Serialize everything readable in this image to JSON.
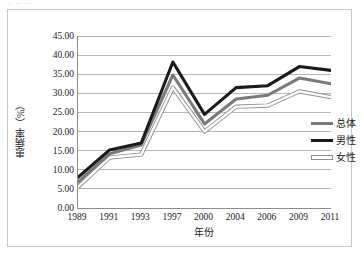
{
  "figure": {
    "top_caption_fragment": "— — —"
  },
  "chart_data": {
    "type": "line",
    "title": "",
    "xlabel": "年份",
    "ylabel": "患病率（%）",
    "categories": [
      "1989",
      "1991",
      "1993",
      "1997",
      "2000",
      "2004",
      "2006",
      "2009",
      "2011"
    ],
    "ylim": [
      0,
      45
    ],
    "ytick_interval": 5,
    "ytick_labels": [
      "45.00",
      "40.00",
      "35.00",
      "30.00",
      "25.00",
      "20.00",
      "15.00",
      "10.00",
      "5.00",
      "0.00"
    ],
    "ytick_values": [
      45,
      40,
      35,
      30,
      25,
      20,
      15,
      10,
      5,
      0
    ],
    "grid": "horizontal",
    "legend_position": "right",
    "series": [
      {
        "name": "总体",
        "color": "#7a7a7a",
        "style": "solid-thick-gray",
        "values": [
          6.8,
          14.2,
          16.5,
          34.8,
          22.0,
          28.5,
          29.5,
          34.0,
          32.5
        ]
      },
      {
        "name": "男性",
        "color": "#1a1a1a",
        "style": "solid-thick-black",
        "values": [
          8.0,
          15.2,
          17.0,
          38.2,
          24.5,
          31.5,
          32.0,
          37.0,
          36.0
        ]
      },
      {
        "name": "女性",
        "color": "#fdfdfd",
        "outline": "#8f8f8f",
        "style": "solid-outlined-white",
        "values": [
          5.5,
          13.2,
          14.0,
          31.5,
          20.0,
          26.5,
          26.8,
          30.5,
          29.0
        ]
      }
    ]
  }
}
